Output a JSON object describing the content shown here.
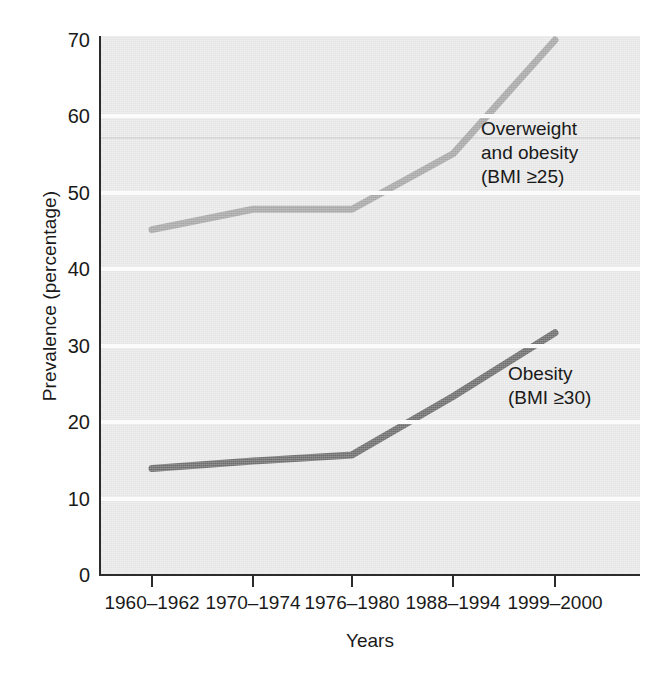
{
  "chart_data": {
    "type": "line",
    "title": "",
    "subtitle": "",
    "xlabel": "Years",
    "ylabel": "Prevalence (percentage)",
    "categories": [
      "1960–1962",
      "1970–1974",
      "1976–1980",
      "1988–1994",
      "1999–2000"
    ],
    "ylim": [
      0,
      70
    ],
    "yticks": [
      0,
      10,
      20,
      30,
      40,
      50,
      60,
      70
    ],
    "ytick_labels": [
      "0",
      "10",
      "20",
      "30",
      "40",
      "50",
      "60",
      "70"
    ],
    "grid": "horizontal",
    "legend": "inline-annotations",
    "series": [
      {
        "name": "Overweight and obesity (BMI ≥25)",
        "label_lines": [
          "Overweight",
          "and obesity",
          "(BMI ≥25)"
        ],
        "color": "#a9a9a9",
        "values": [
          45,
          47.7,
          47.7,
          55,
          70
        ]
      },
      {
        "name": "Obesity (BMI ≥30)",
        "label_lines": [
          "Obesity",
          "(BMI ≥30)"
        ],
        "color": "#6e6e6e",
        "values": [
          13.5,
          14.5,
          15.3,
          23,
          31.4
        ]
      }
    ],
    "annotations": [
      {
        "id": "overweight",
        "text": "Overweight\nand obesity\n(BMI ≥25)"
      },
      {
        "id": "obesity",
        "text": "Obesity\n(BMI ≥30)"
      }
    ],
    "colors": {
      "plot_background": "#eaeaea",
      "gridline": "#fbfbfb",
      "axis": "#2b2b2b",
      "text": "#1a1a1a",
      "series_overweight": "#a9a9a9",
      "series_obesity": "#6e6e6e"
    }
  },
  "axes": {
    "y_title": "Prevalence (percentage)",
    "x_title": "Years",
    "y_ticks": [
      {
        "value": "70"
      },
      {
        "value": "60"
      },
      {
        "value": "50"
      },
      {
        "value": "40"
      },
      {
        "value": "30"
      },
      {
        "value": "20"
      },
      {
        "value": "10"
      },
      {
        "value": "0"
      }
    ],
    "x_ticks": [
      {
        "label": "1960–1962"
      },
      {
        "label": "1970–1974"
      },
      {
        "label": "1976–1980"
      },
      {
        "label": "1988–1994"
      },
      {
        "label": "1999–2000"
      }
    ]
  },
  "annotations": {
    "overweight": "Overweight\nand obesity\n(BMI ≥25)",
    "obesity": "Obesity\n(BMI ≥30)"
  }
}
